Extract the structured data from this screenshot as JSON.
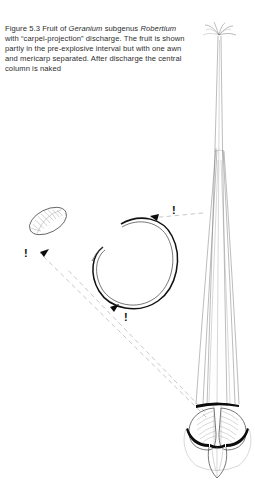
{
  "figure": {
    "number": "5.3",
    "caption_segments": [
      {
        "text": "Figure 5.3 Fruit of ",
        "style": "roman"
      },
      {
        "text": "Geranium",
        "style": "italic"
      },
      {
        "text": " subgenus ",
        "style": "roman"
      },
      {
        "text": "Robertium",
        "style": "italic"
      },
      {
        "text": " with “carpel-projection” discharge. The fruit is shown partly in the pre-explosive interval but with one awn and mericarp separated. After discharge the central column is naked",
        "style": "roman"
      }
    ],
    "caption_plain": "Figure 5.3 Fruit of Geranium subgenus Robertium with “carpel-projection” discharge. The fruit is shown partly in the pre-explosive interval but with one awn and mericarp separated. After discharge the central column is naked"
  },
  "illustration": {
    "type": "botanical-line-drawing",
    "subject": "Geranium subgenus Robertium fruit, carpel-projection discharge",
    "technique": "ink line engraving, hatched shading, monochrome",
    "background_color": "#ffffff",
    "ink_color": "#111111",
    "hatch_color": "#6a6a6a",
    "trajectory_color": "#b9b9b9",
    "parts": [
      {
        "name": "central-column",
        "label": "central column (rostrum)",
        "description": "tall slender vertical column running from upper right down to the fruit base, naked after discharge",
        "orientation": "vertical"
      },
      {
        "name": "stigma-crown",
        "label": "stigmatic crown",
        "description": "five recurved stigma lobes radiating from the apex of the column",
        "lobes": 5
      },
      {
        "name": "attached-awns",
        "label": "attached awns",
        "description": "parallel longitudinal awn strands sheathing the column in the pre-explosive interval"
      },
      {
        "name": "mericarp-cluster",
        "label": "mericarps at base",
        "description": "two striated mericarp bodies at the base of the column with dark crescent scars where carpels detach",
        "count": 2
      },
      {
        "name": "detached-mericarp",
        "label": "separated mericarp",
        "description": "single ovoid mericarp with fine internal striations, shown thrown clear at upper left"
      },
      {
        "name": "coiled-awn",
        "label": "separated awn",
        "description": "heavy curved awn coiled into a near-closed loop after discharge, at centre of plate"
      }
    ],
    "trajectories": [
      {
        "name": "trajectory-to-mericarp",
        "label": "flight path of mericarp",
        "style": "dashed"
      },
      {
        "name": "trajectory-to-awn-lower",
        "label": "flight path of awn (lower)",
        "style": "dashed"
      },
      {
        "name": "trajectory-to-awn-upper",
        "label": "flight path of awn (upper)",
        "style": "dashed"
      }
    ],
    "markers": [
      {
        "name": "exclamation-marker-mericarp",
        "symbol": "!",
        "x": 24,
        "y": 248
      },
      {
        "name": "exclamation-marker-awn-lower",
        "symbol": "!",
        "x": 124,
        "y": 312
      },
      {
        "name": "exclamation-marker-awn-upper",
        "symbol": "!",
        "x": 172,
        "y": 205
      }
    ],
    "arrowheads": [
      {
        "name": "arrowhead-mericarp",
        "direction": "up-left"
      },
      {
        "name": "arrowhead-awn-lower",
        "direction": "up-left"
      },
      {
        "name": "arrowhead-awn-upper",
        "direction": "left"
      }
    ]
  }
}
